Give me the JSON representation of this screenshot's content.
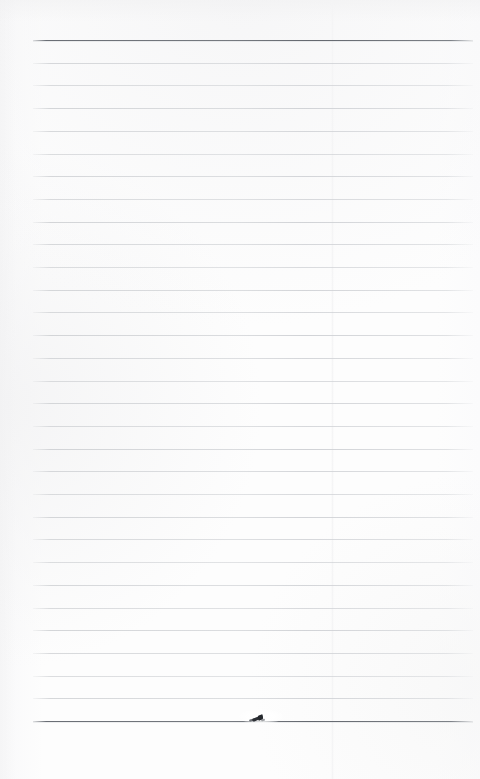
{
  "document": {
    "kind": "scanned-lined-notebook-page",
    "title": "Blank ruled notebook page (scan)",
    "page_width": 480,
    "page_height": 779,
    "background_color": "#fcfcfc",
    "content_text": "",
    "has_handwriting": false
  },
  "ruling": {
    "line_count": 31,
    "first_line_y": 40,
    "line_spacing": 22.7,
    "line_left_x": 33,
    "line_right_x": 473,
    "line_width": 440,
    "light_line_color": "#d7d9db",
    "heavy_line_color": "#6e7278",
    "heavy_line_indices": [
      0,
      30
    ],
    "margin_rule": "none",
    "bottom_margin_px": 58,
    "top_margin_px": 40
  },
  "scan_artifacts": {
    "vertical_seam_x": 332,
    "seam_color": "#f4f4f5",
    "edge_shading_color": "#f0f0f1"
  },
  "ink_mark": {
    "name": "ink-smudge",
    "description": "small dark diagonal pen stroke on the bottom heavy rule",
    "x": 252,
    "y": 715,
    "width": 16,
    "height": 9,
    "color": "#2c2f34",
    "halo_color": "#ffffff"
  }
}
